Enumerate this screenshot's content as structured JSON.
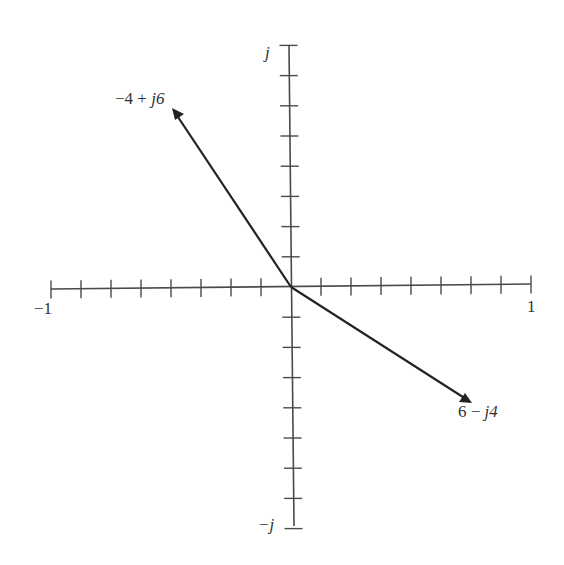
{
  "diagram": {
    "type": "complex-plane-phasor",
    "axes": {
      "real": {
        "min_label": "−1",
        "max_label": "1",
        "ticks_each_side": 8
      },
      "imag": {
        "max_label": "j",
        "min_label": "−j",
        "ticks_each_side": 8
      }
    },
    "vectors": [
      {
        "label_real": "−4 + ",
        "label_imag": "j6",
        "re": -4,
        "im": 6
      },
      {
        "label_real": "6 − ",
        "label_imag": "j4",
        "re": 6,
        "im": -4
      }
    ],
    "colors": {
      "axis": "#4a4a4a",
      "vector": "#222222",
      "text": "#333333"
    }
  }
}
